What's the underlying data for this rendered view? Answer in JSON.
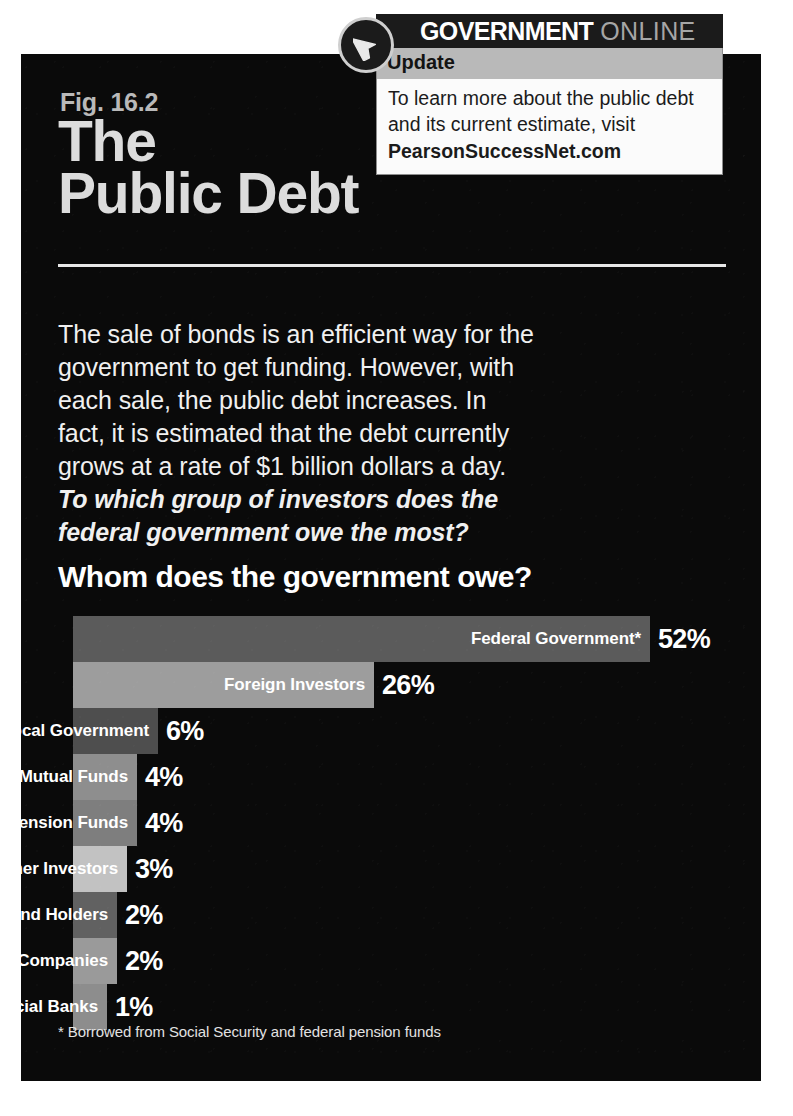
{
  "figure": {
    "number": "Fig. 16.2",
    "title_line1": "The",
    "title_line2": "Public Debt",
    "body_text": "The sale of bonds is an efficient way for the government to get funding. However, with each sale, the public debt increases. In fact, it is estimated that the debt currently grows at a rate of $1 billion dollars a day. ",
    "body_question": "To which group of investors does the federal government owe the most?",
    "footnote": "* Borrowed from Social Security and federal pension funds"
  },
  "callout": {
    "icon": "cursor-arrow-icon",
    "brand_strong": "GOVERNMENT",
    "brand_light": "ONLINE",
    "band_label": "Update",
    "body": "To learn more about the public debt and its current estimate, visit",
    "site": "PearsonSuccessNet.com"
  },
  "chart_data": {
    "type": "bar",
    "title": "Whom does the government owe?",
    "orientation": "horizontal",
    "xlabel": "",
    "ylabel": "",
    "grid": false,
    "legend": "none",
    "value_suffix": "%",
    "categories": [
      "Federal Government*",
      "Foreign Investors",
      "State and Local Government",
      "Mutual Funds",
      "Pension Funds",
      "Other Investors",
      "Bond Holders",
      "Insurance Companies",
      "Commercial Banks"
    ],
    "values": [
      52,
      26,
      6,
      4,
      4,
      3,
      2,
      2,
      1
    ],
    "value_labels": [
      "52%",
      "26%",
      "6%",
      "4%",
      "4%",
      "3%",
      "2%",
      "2%",
      "1%"
    ],
    "bar_pixel_widths": [
      577,
      301,
      85,
      64,
      64,
      54,
      44,
      44,
      34
    ],
    "bar_colors": [
      "#5b5b5b",
      "#9d9d9d",
      "#4e4e4e",
      "#8e8e8e",
      "#7e7e7e",
      "#c2c2c2",
      "#616161",
      "#9a9a9a",
      "#8d8d8d"
    ],
    "label_inside_bar": [
      true,
      true,
      false,
      false,
      false,
      false,
      false,
      false,
      false
    ],
    "footnote": "* Borrowed from Social Security and federal pension funds"
  },
  "colors": {
    "panel_background": "#0a0a0a",
    "title_text": "#dcdcdc",
    "body_text": "#f0f0f0",
    "callout_bar": "#1b1b1b",
    "callout_band": "#b9b9b9",
    "callout_box": "#fbfbfb"
  }
}
